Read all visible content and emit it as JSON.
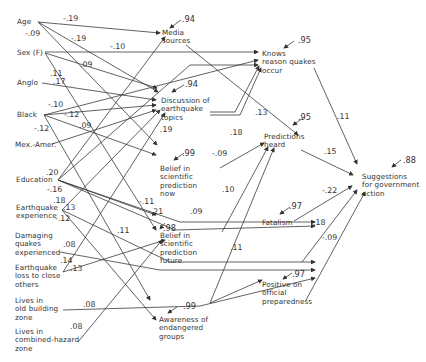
{
  "diagram": {
    "type": "path-diagram",
    "exogenous": [
      {
        "id": "age",
        "label": "Age"
      },
      {
        "id": "sex",
        "label": "Sex (F)"
      },
      {
        "id": "anglo",
        "label": "Anglo"
      },
      {
        "id": "black",
        "label": "Black"
      },
      {
        "id": "mex",
        "label": "Mex.-Amer."
      },
      {
        "id": "edu",
        "label": "Education"
      },
      {
        "id": "eqexp",
        "label": "Earthquake\nexperience"
      },
      {
        "id": "damq",
        "label": "Damaging\nquakes\nexperienced"
      },
      {
        "id": "eqloss",
        "label": "Earthquake\nloss to close\nothers"
      },
      {
        "id": "oldbld",
        "label": "Lives in\nold building\nzone"
      },
      {
        "id": "combhz",
        "label": "Lives in\ncombined-hazard\nzone"
      }
    ],
    "mediators": [
      {
        "id": "media",
        "label": "Media\nsources",
        "residual": ".94"
      },
      {
        "id": "disc",
        "label": "Discussion of\nearthquake\ntopics",
        "residual": ".94"
      },
      {
        "id": "bnow",
        "label": "Belief in\nscientific\nprediction\nnow",
        "residual": ".99"
      },
      {
        "id": "bfut",
        "label": "Belief in\nscientific\nprediction\nfuture",
        "residual": ".98"
      },
      {
        "id": "aware",
        "label": "Awareness of\nendangered\ngroups",
        "residual": ".99"
      }
    ],
    "outcomes": [
      {
        "id": "know",
        "label": "Knows\nreason quakes\noccur",
        "residual": ".95"
      },
      {
        "id": "pred",
        "label": "Predictions\nheard",
        "residual": ".95"
      },
      {
        "id": "fatal",
        "label": "Fatalism",
        "residual": ".97"
      },
      {
        "id": "pos",
        "label": "Positive on\nofficial\npreparedness",
        "residual": ".97"
      }
    ],
    "final": {
      "id": "sugg",
      "label": "Suggestions\nfor government\naction",
      "residual": ".88"
    },
    "coefficients": [
      {
        "from": "age",
        "to": "media",
        "value": "-.19"
      },
      {
        "from": "age",
        "to": "disc",
        "value": "-.19"
      },
      {
        "from": "age",
        "to": "bnow",
        "value": "-.09"
      },
      {
        "from": "sex",
        "to": "know",
        "value": "-.10"
      },
      {
        "from": "sex",
        "to": "disc",
        "value": ".09"
      },
      {
        "from": "sex",
        "to": "bfut",
        "value": ".11"
      },
      {
        "from": "anglo",
        "to": "disc",
        "value": ".17"
      },
      {
        "from": "black",
        "to": "know",
        "value": "-.10"
      },
      {
        "from": "black",
        "to": "disc",
        "value": "-.12"
      },
      {
        "from": "black",
        "to": "bnow",
        "value": "-.12"
      },
      {
        "from": "mex",
        "to": "disc",
        "value": ".09"
      },
      {
        "from": "edu",
        "to": "media",
        "value": ".20"
      },
      {
        "from": "edu",
        "to": "know",
        "value": ".19"
      },
      {
        "from": "edu",
        "to": "bfut",
        "value": "-.16"
      },
      {
        "from": "edu",
        "to": "fatal",
        "value": "-.11"
      },
      {
        "from": "edu",
        "to": "fatal",
        "value": "-.21"
      },
      {
        "from": "eqexp",
        "to": "disc",
        "value": ".18"
      },
      {
        "from": "eqexp",
        "to": "pred",
        "value": ".13"
      },
      {
        "from": "eqexp",
        "to": "aware",
        "value": "-.12"
      },
      {
        "from": "eqexp",
        "to": "pos",
        "value": ".11"
      },
      {
        "from": "damq",
        "to": "pos",
        "value": ".08"
      },
      {
        "from": "eqloss",
        "to": "disc",
        "value": ".14"
      },
      {
        "from": "eqloss",
        "to": "pred",
        "value": ".13"
      },
      {
        "from": "oldbld",
        "to": "pos",
        "value": ".08"
      },
      {
        "from": "combhz",
        "to": "bfut",
        "value": ".08"
      },
      {
        "from": "media",
        "to": "pred",
        "value": ".13"
      },
      {
        "from": "disc",
        "to": "pred",
        "value": ".18"
      },
      {
        "from": "bnow",
        "to": "pred",
        "value": "-.09"
      },
      {
        "from": "bfut",
        "to": "pred",
        "value": ".10"
      },
      {
        "from": "bfut",
        "to": "fatal",
        "value": ".09"
      },
      {
        "from": "aware",
        "to": "pred",
        "value": ".11"
      },
      {
        "from": "know",
        "to": "sugg",
        "value": ".11"
      },
      {
        "from": "pred",
        "to": "sugg",
        "value": ".15"
      },
      {
        "from": "fatal",
        "to": "sugg",
        "value": "-.22"
      },
      {
        "from": "pos",
        "to": "sugg",
        "value": "-.09"
      },
      {
        "from": "aware",
        "to": "sugg",
        "value": ".18"
      }
    ]
  }
}
